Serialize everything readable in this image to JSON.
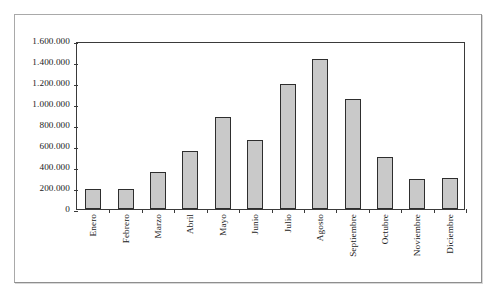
{
  "chart_data": {
    "type": "bar",
    "title": "",
    "subtitle": "",
    "xlabel": "",
    "ylabel": "",
    "categories": [
      "Enero",
      "Febrero",
      "Marzo",
      "Abril",
      "Mayo",
      "Junio",
      "Julio",
      "Agosto",
      "Septiembre",
      "Octubre",
      "Noviembre",
      "Diciembre"
    ],
    "values": [
      190000,
      192000,
      352000,
      550000,
      875000,
      655000,
      1190000,
      1430000,
      1050000,
      500000,
      285000,
      300000
    ],
    "ylim": [
      0,
      1600000
    ],
    "ytick_values": [
      0,
      200000,
      400000,
      600000,
      800000,
      1000000,
      1200000,
      1400000,
      1600000
    ],
    "ytick_labels": [
      "0",
      "200.000",
      "400.000",
      "600.000",
      "800.000",
      "1.000.000",
      "1.200.000",
      "1.400.000",
      "1.600.000"
    ],
    "grid": false,
    "legend": null,
    "legend_position": "none",
    "bar_fill_color": "#c9c9c9",
    "bar_border_color": "#2e2e2e",
    "axis_color": "#3a3a3a",
    "background_color": "#ffffff",
    "frame_border_color": "#a9a9a9",
    "annotations": []
  }
}
